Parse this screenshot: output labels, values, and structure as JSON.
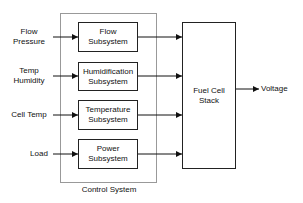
{
  "diagram": {
    "inputs": [
      {
        "line1": "Flow",
        "line2": "Pressure"
      },
      {
        "line1": "Temp",
        "line2": "Humidity"
      },
      {
        "line1": "Cell Temp",
        "line2": ""
      },
      {
        "line1": "Load",
        "line2": ""
      }
    ],
    "subsystems": [
      {
        "line1": "Flow",
        "line2": "Subsystem"
      },
      {
        "line1": "Humidification",
        "line2": "Subsystem"
      },
      {
        "line1": "Temperature",
        "line2": "Subsystem"
      },
      {
        "line1": "Power",
        "line2": "Subsystem"
      }
    ],
    "control_system_label": "Control System",
    "stack": {
      "line1": "Fuel Cell",
      "line2": "Stack"
    },
    "output": "Voltage"
  }
}
